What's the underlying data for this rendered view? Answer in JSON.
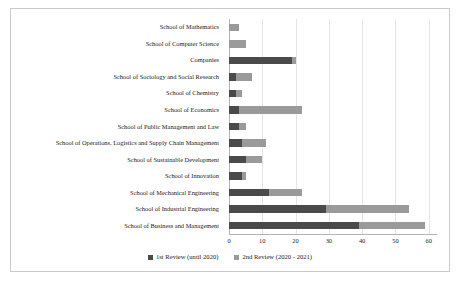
{
  "chart_data": {
    "type": "bar",
    "orientation": "horizontal",
    "stacked": true,
    "title": "",
    "xlabel": "",
    "ylabel": "",
    "xlim": [
      0,
      62.5
    ],
    "xticks": [
      0,
      10,
      20,
      30,
      40,
      50,
      60
    ],
    "grid": true,
    "legend_position": "bottom",
    "categories": [
      "School of Mathematics",
      "School of Computer Science",
      "Companies",
      "School of Sociology and Social Research",
      "School of Chemistry",
      "School of Economics",
      "School of Public Management and Law",
      "School of Operations, Logistics and Supply Chain Management",
      "School of Sustainable Development",
      "School of Innovation",
      "School of Mechanical Engineering",
      "School of Industrial Engineering",
      "School of Business and Management"
    ],
    "series": [
      {
        "name": "1st Review (until 2020)",
        "color": "#4a4a4a",
        "values": [
          0,
          0,
          19,
          2,
          2,
          3,
          3,
          4,
          5,
          4,
          12,
          29,
          39
        ]
      },
      {
        "name": "2nd Review (2020 - 2021)",
        "color": "#9a9a9a",
        "values": [
          3,
          5,
          1,
          5,
          2,
          19,
          2,
          7,
          5,
          1,
          10,
          25,
          20
        ]
      }
    ],
    "totals": [
      3,
      5,
      20,
      7,
      4,
      22,
      5,
      11,
      10,
      5,
      22,
      54,
      59
    ]
  },
  "legend": {
    "entries": [
      {
        "label": "1st Review (until 2020)",
        "color": "#4a4a4a"
      },
      {
        "label": "2nd Review (2020 - 2021)",
        "color": "#9a9a9a"
      }
    ]
  }
}
